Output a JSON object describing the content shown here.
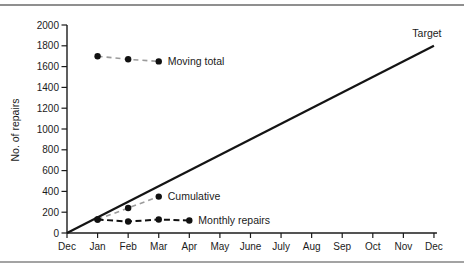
{
  "figure": {
    "background": "#ffffff",
    "top_rule_color": "#8f8f8f",
    "bottom_rule_color": "#a3a3a3"
  },
  "chart_data": {
    "type": "line",
    "title": "",
    "xlabel": "",
    "ylabel": "No. of repairs",
    "x_tick_labels": [
      "Dec",
      "Jan",
      "Feb",
      "Mar",
      "Apr",
      "May",
      "June",
      "July",
      "Aug",
      "Sep",
      "Oct",
      "Nov",
      "Dec"
    ],
    "y_tick_values": [
      0,
      200,
      400,
      600,
      800,
      1000,
      1200,
      1400,
      1600,
      1800,
      2000
    ],
    "ylim": [
      0,
      2000
    ],
    "grid": false,
    "legend_position": "inline-annotations",
    "axis_color": "#1b1b1b",
    "marker_color": "#111111",
    "series": [
      {
        "name": "Target",
        "label_text": "Target",
        "month_indices": [
          0,
          12
        ],
        "values": [
          0,
          1800
        ],
        "line_color": "#141414",
        "dash": "",
        "line_width": 2.2,
        "markers": false,
        "label_placement": "above-end"
      },
      {
        "name": "Moving total",
        "label_text": "Moving total",
        "month_indices": [
          1,
          2,
          3
        ],
        "values": [
          1700,
          1670,
          1650
        ],
        "line_color": "#9b9b9b",
        "dash": "5 4",
        "line_width": 1.6,
        "markers": true,
        "label_placement": "right-of-last"
      },
      {
        "name": "Cumulative",
        "label_text": "Cumulative",
        "month_indices": [
          1,
          2,
          3
        ],
        "values": [
          130,
          240,
          350
        ],
        "line_color": "#9b9b9b",
        "dash": "5 4",
        "line_width": 1.6,
        "markers": true,
        "label_placement": "right-of-last"
      },
      {
        "name": "Monthly repairs",
        "label_text": "Monthly repairs",
        "month_indices": [
          1,
          2,
          3,
          4
        ],
        "values": [
          130,
          110,
          130,
          120
        ],
        "line_color": "#111111",
        "dash": "6 3.5",
        "line_width": 2,
        "markers": true,
        "label_placement": "right-of-last"
      }
    ]
  }
}
